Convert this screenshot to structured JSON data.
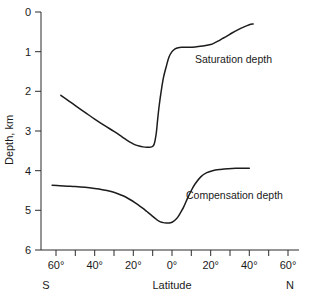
{
  "chart_data": {
    "type": "line",
    "title": "",
    "xlabel": "Latitude",
    "ylabel": "Depth, km",
    "grid": false,
    "legend_position": "inline-annotation",
    "xlim": [
      -65,
      65
    ],
    "ylim": [
      6,
      0
    ],
    "y_axis_inverted": true,
    "xaxis": {
      "label": "Latitude",
      "tick_labels": [
        "60°",
        "40°",
        "20°",
        "0°",
        "20°",
        "40°",
        "60°"
      ],
      "tick_values": [
        -60,
        -40,
        -20,
        0,
        20,
        40,
        60
      ],
      "minor_tick_values": [
        -60,
        -50,
        -40,
        -30,
        -20,
        -10,
        0,
        10,
        20,
        30,
        40,
        50,
        60
      ],
      "left_end_label": "S",
      "right_end_label": "N"
    },
    "yaxis": {
      "label": "Depth, km",
      "tick_labels": [
        "0",
        "1",
        "2",
        "3",
        "4",
        "5",
        "6"
      ],
      "tick_values": [
        0,
        1,
        2,
        3,
        4,
        5,
        6
      ]
    },
    "series": [
      {
        "name": "Saturation depth",
        "annotation": "Saturation depth",
        "color": "#1c1c1c",
        "x": [
          -57.5,
          -54,
          -50,
          -45,
          -40,
          -35,
          -30,
          -26,
          -23,
          -21,
          -19,
          -17,
          -15,
          -13,
          -11.5,
          -10.5,
          -9.8,
          -9.2,
          -8.6,
          -8.0,
          -7.4,
          -6.6,
          -5.6,
          -4.4,
          -3.0,
          -1.6,
          0.0,
          1.6,
          3.2,
          5.0,
          7.0,
          9.0,
          12.0,
          16.0,
          20.0,
          22.0,
          24.0,
          26.0,
          28.0,
          31.0,
          34.0,
          37.0,
          40.0,
          42.0
        ],
        "y": [
          2.1,
          2.22,
          2.36,
          2.53,
          2.7,
          2.86,
          3.01,
          3.14,
          3.24,
          3.3,
          3.35,
          3.38,
          3.4,
          3.41,
          3.41,
          3.4,
          3.38,
          3.33,
          3.2,
          3.0,
          2.7,
          2.35,
          2.0,
          1.65,
          1.38,
          1.14,
          1.0,
          0.93,
          0.9,
          0.89,
          0.89,
          0.89,
          0.88,
          0.86,
          0.82,
          0.78,
          0.73,
          0.67,
          0.62,
          0.53,
          0.45,
          0.38,
          0.32,
          0.3
        ]
      },
      {
        "name": "Compensation depth",
        "annotation": "Compensation depth",
        "color": "#1c1c1c",
        "x": [
          -62.0,
          -58,
          -54,
          -50,
          -45,
          -40,
          -36,
          -32,
          -28,
          -25,
          -22,
          -19,
          -17,
          -15,
          -13,
          -11,
          -9,
          -7.5,
          -6,
          -4.5,
          -3,
          -1.5,
          0,
          1.5,
          3,
          4.5,
          6,
          8,
          10,
          12,
          15,
          18,
          21,
          25,
          29,
          33,
          37,
          40
        ],
        "y": [
          4.37,
          4.38,
          4.39,
          4.4,
          4.42,
          4.45,
          4.48,
          4.52,
          4.58,
          4.64,
          4.72,
          4.81,
          4.88,
          4.95,
          5.03,
          5.11,
          5.19,
          5.25,
          5.29,
          5.31,
          5.32,
          5.32,
          5.3,
          5.25,
          5.17,
          5.05,
          4.92,
          4.7,
          4.5,
          4.33,
          4.15,
          4.05,
          4.0,
          3.97,
          3.95,
          3.94,
          3.94,
          3.94
        ]
      }
    ],
    "annotations": [
      {
        "text": "Saturation depth",
        "x": 22,
        "y": 1.5
      },
      {
        "text": "Compensation depth",
        "x": 22,
        "y": 4.65
      }
    ]
  }
}
